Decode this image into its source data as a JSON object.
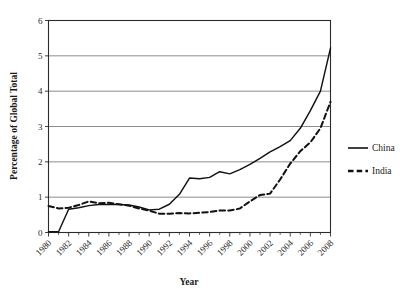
{
  "chart_data": {
    "type": "line",
    "title": "",
    "xlabel": "Year",
    "ylabel": "Percentage of Global Total",
    "xlim": [
      1980,
      2008
    ],
    "ylim": [
      0,
      6
    ],
    "grid": true,
    "legend_position": "right",
    "y_ticks": [
      "0",
      "1",
      "2",
      "3",
      "4",
      "5",
      "6"
    ],
    "y_tick_values": [
      0,
      1,
      2,
      3,
      4,
      5,
      6
    ],
    "x_ticks": [
      "1980",
      "1982",
      "1984",
      "1986",
      "1988",
      "1990",
      "1992",
      "1994",
      "1996",
      "1998",
      "2000",
      "2002",
      "2004",
      "2006",
      "2008"
    ],
    "x_tick_values": [
      1980,
      1982,
      1984,
      1986,
      1988,
      1990,
      1992,
      1994,
      1996,
      1998,
      2000,
      2002,
      2004,
      2006,
      2008
    ],
    "x": [
      1980,
      1981,
      1982,
      1983,
      1984,
      1985,
      1986,
      1987,
      1988,
      1989,
      1990,
      1991,
      1992,
      1993,
      1994,
      1995,
      1996,
      1997,
      1998,
      1999,
      2000,
      2001,
      2002,
      2003,
      2004,
      2005,
      2006,
      2007,
      2008
    ],
    "series": [
      {
        "name": "China",
        "style": "solid",
        "color": "#111111",
        "values": [
          0.02,
          0.02,
          0.66,
          0.7,
          0.76,
          0.79,
          0.79,
          0.79,
          0.78,
          0.72,
          0.64,
          0.66,
          0.8,
          1.08,
          1.54,
          1.52,
          1.56,
          1.72,
          1.66,
          1.78,
          1.93,
          2.1,
          2.28,
          2.43,
          2.6,
          2.95,
          3.45,
          4.0,
          5.22
        ]
      },
      {
        "name": "India",
        "style": "dashed",
        "color": "#111111",
        "values": [
          0.75,
          0.68,
          0.7,
          0.78,
          0.88,
          0.83,
          0.84,
          0.8,
          0.76,
          0.68,
          0.62,
          0.53,
          0.53,
          0.55,
          0.54,
          0.56,
          0.58,
          0.62,
          0.62,
          0.68,
          0.88,
          1.06,
          1.1,
          1.5,
          1.95,
          2.3,
          2.55,
          2.95,
          3.7
        ]
      }
    ],
    "legend": [
      {
        "label": "China",
        "style": "solid"
      },
      {
        "label": "India",
        "style": "dashed"
      }
    ]
  }
}
